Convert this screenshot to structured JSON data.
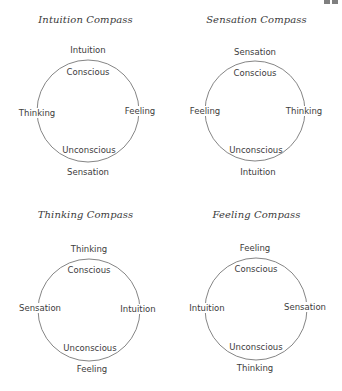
{
  "page": {
    "page_number_fragment": "91"
  },
  "colors": {
    "background": "#ffffff",
    "text": "#3c3c3c",
    "circle_stroke": "#777777"
  },
  "compasses": [
    {
      "title": "Intuition Compass",
      "top": "Intuition",
      "bottom": "Sensation",
      "left": "Thinking",
      "right": "Feeling",
      "upper_inner": "Conscious",
      "lower_inner": "Unconscious"
    },
    {
      "title": "Sensation Compass",
      "top": "Sensation",
      "bottom": "Intuition",
      "left": "Feeling",
      "right": "Thinking",
      "upper_inner": "Conscious",
      "lower_inner": "Unconscious"
    },
    {
      "title": "Thinking Compass",
      "top": "Thinking",
      "bottom": "Feeling",
      "left": "Sensation",
      "right": "Intuition",
      "upper_inner": "Conscious",
      "lower_inner": "Unconscious"
    },
    {
      "title": "Feeling Compass",
      "top": "Feeling",
      "bottom": "Thinking",
      "left": "Intuition",
      "right": "Sensation",
      "upper_inner": "Conscious",
      "lower_inner": "Unconscious"
    }
  ]
}
